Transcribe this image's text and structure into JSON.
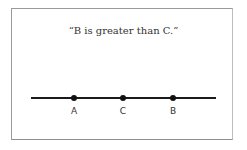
{
  "statement": "“B is greater than C.”",
  "number_line": {
    "points": [
      {
        "label": "A",
        "x": 74
      },
      {
        "label": "C",
        "x": 123
      },
      {
        "label": "B",
        "x": 173
      }
    ],
    "line_color": "#1a1a1a"
  }
}
